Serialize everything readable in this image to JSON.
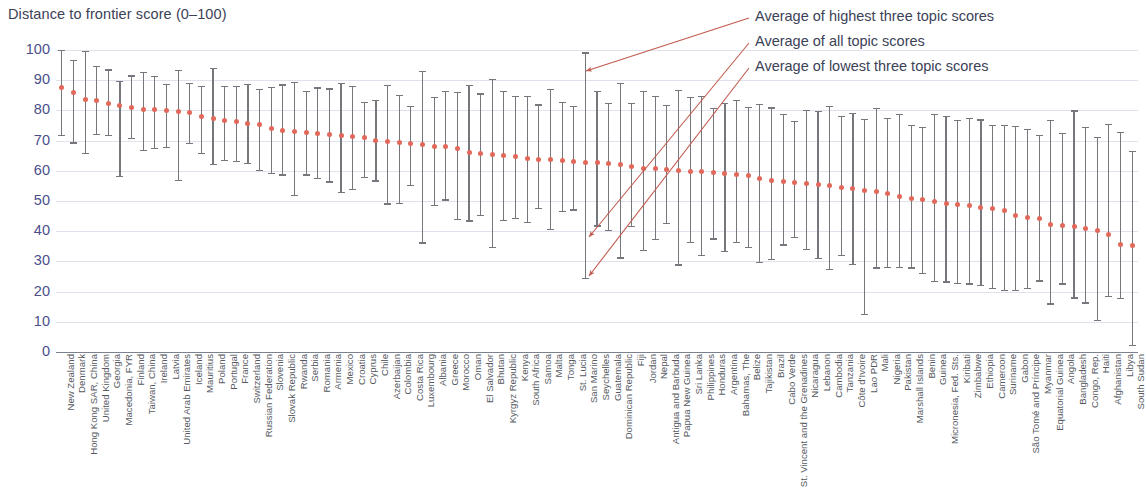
{
  "chart_data": {
    "type": "scatter",
    "title": "Distance to frontier score (0–100)",
    "xlabel": "",
    "ylabel": "Distance to frontier score (0–100)",
    "ylim": [
      0,
      100
    ],
    "yticks": [
      0,
      10,
      20,
      30,
      40,
      50,
      60,
      70,
      80,
      90,
      100
    ],
    "grid": true,
    "legend_position": "top-right-annotations",
    "annotations": [
      "Average of highest three topic scores",
      "Average of all topic scores",
      "Average of lowest three topic scores"
    ],
    "colors": {
      "marker": "#e2685a",
      "whisker": "#76777c",
      "gridline": "#dfe2ea",
      "ytick_label": "#4a4f8c",
      "text": "#3c4257",
      "annotation_leader": "#c25a4e"
    },
    "series": [
      {
        "name": "Average of highest three topic scores",
        "role": "high"
      },
      {
        "name": "Average of all topic scores",
        "role": "mean"
      },
      {
        "name": "Average of lowest three topic scores",
        "role": "low"
      }
    ],
    "categories": [
      "New Zealand",
      "Denmark",
      "Hong Kong SAR, China",
      "United Kingdom",
      "Georgia",
      "Macedonia, FYR",
      "Finland",
      "Taiwan, China",
      "Ireland",
      "Latvia",
      "United Arab Emirates",
      "Iceland",
      "Mauritius",
      "Poland",
      "Portugal",
      "France",
      "Switzerland",
      "Russian Federation",
      "Slovenia",
      "Slovak Republic",
      "Rwanda",
      "Serbia",
      "Romania",
      "Armenia",
      "Mexico",
      "Croatia",
      "Cyprus",
      "Chile",
      "Azerbaijan",
      "Colombia",
      "Costa Rica",
      "Luxembourg",
      "Albania",
      "Greece",
      "Morocco",
      "Oman",
      "El Salvador",
      "Bhutan",
      "Kyrgyz Republic",
      "Kenya",
      "South Africa",
      "Samoa",
      "Malta",
      "Tonga",
      "St. Lucia",
      "San Marino",
      "Seychelles",
      "Guatemala",
      "Dominican Republic",
      "Fiji",
      "Jordan",
      "Nepal",
      "Antigua and Barbuda",
      "Papua New Guinea",
      "Sri Lanka",
      "Philippines",
      "Honduras",
      "Argentina",
      "Bahamas, The",
      "Belize",
      "Tajikistan",
      "Brazil",
      "Cabo Verde",
      "St. Vincent and the Grenadines",
      "Nicaragua",
      "Lebanon",
      "Cambodia",
      "Tanzania",
      "Côte d'Ivoire",
      "Lao PDR",
      "Mali",
      "Nigeria",
      "Pakistan",
      "Marshall Islands",
      "Benin",
      "Guinea",
      "Micronesia, Fed. Sts.",
      "Kiribati",
      "Zimbabwe",
      "Ethiopia",
      "Cameroon",
      "Suriname",
      "Gabon",
      "São Tomé and Príncipe",
      "Myanmar",
      "Equatorial Guinea",
      "Angola",
      "Bangladesh",
      "Congo, Rep.",
      "Haiti",
      "Afghanistan",
      "Libya",
      "South Sudan"
    ],
    "mean": [
      87.5,
      86.0,
      83.5,
      83.3,
      82.2,
      81.5,
      80.8,
      80.4,
      80.2,
      80.0,
      79.7,
      79.3,
      78.0,
      77.2,
      76.8,
      76.3,
      75.6,
      75.2,
      74.0,
      73.4,
      73.0,
      72.7,
      72.4,
      72.1,
      71.6,
      71.4,
      70.9,
      70.2,
      69.8,
      69.3,
      69.0,
      68.6,
      68.2,
      68.0,
      67.4,
      66.0,
      65.8,
      65.5,
      65.2,
      64.6,
      64.2,
      63.9,
      63.6,
      63.3,
      63.1,
      62.9,
      62.7,
      62.4,
      62.0,
      61.4,
      60.9,
      60.6,
      60.3,
      60.1,
      59.9,
      59.7,
      59.5,
      59.2,
      58.9,
      58.6,
      57.6,
      56.8,
      56.4,
      56.0,
      55.7,
      55.3,
      55.0,
      54.6,
      54.0,
      53.6,
      53.2,
      52.5,
      51.6,
      50.7,
      50.4,
      49.9,
      49.2,
      48.9,
      48.4,
      47.9,
      47.4,
      46.7,
      45.2,
      44.6,
      44.2,
      42.3,
      41.8,
      41.5,
      41.0,
      40.2,
      38.8,
      35.7,
      35.4,
      32.1
    ],
    "high": [
      100.0,
      96.8,
      99.8,
      94.6,
      93.6,
      89.9,
      91.6,
      92.8,
      91.4,
      88.9,
      93.4,
      89.2,
      88.1,
      94.0,
      88.1,
      88.1,
      88.8,
      87.0,
      87.7,
      88.6,
      89.5,
      86.5,
      87.6,
      87.3,
      89.0,
      88.2,
      82.9,
      83.4,
      88.5,
      85.0,
      81.6,
      93.0,
      84.5,
      86.5,
      86.0,
      88.4,
      85.6,
      90.3,
      86.4,
      84.9,
      84.9,
      82.0,
      87.0,
      82.7,
      81.6,
      99.2,
      86.5,
      82.5,
      89.1,
      82.4,
      86.4,
      84.8,
      81.7,
      86.7,
      84.6,
      84.9,
      80.7,
      82.6,
      83.4,
      81.2,
      82.2,
      81.0,
      78.8,
      76.6,
      80.2,
      79.9,
      81.5,
      78.1,
      79.1,
      77.2,
      80.8,
      77.5,
      78.8,
      75.1,
      74.4,
      78.9,
      78.1,
      76.8,
      77.6,
      77.0,
      75.1,
      75.1,
      74.9,
      74.0,
      71.9,
      76.9,
      72.6,
      80.0,
      74.5,
      71.3,
      75.4,
      72.9,
      66.6,
      68.8
    ],
    "low": [
      71.9,
      69.4,
      65.8,
      72.3,
      71.9,
      58.3,
      71.0,
      66.9,
      67.5,
      67.9,
      57.0,
      69.3,
      65.9,
      62.2,
      63.6,
      63.4,
      62.6,
      60.2,
      59.4,
      58.8,
      52.0,
      58.8,
      57.7,
      56.5,
      52.9,
      54.0,
      58.0,
      56.8,
      49.2,
      49.5,
      55.3,
      36.3,
      48.8,
      50.5,
      44.1,
      43.6,
      45.3,
      34.7,
      43.7,
      44.3,
      43.2,
      47.6,
      40.7,
      46.6,
      47.2,
      24.5,
      41.9,
      40.5,
      31.3,
      41.8,
      33.9,
      37.4,
      42.8,
      29.0,
      36.4,
      32.2,
      37.6,
      33.6,
      36.5,
      34.8,
      29.9,
      30.9,
      35.6,
      38.1,
      34.1,
      31.2,
      27.6,
      32.2,
      29.1,
      12.5,
      28.0,
      28.2,
      28.2,
      28.0,
      26.1,
      23.6,
      23.4,
      22.9,
      22.7,
      22.2,
      21.2,
      20.6,
      20.6,
      21.1,
      23.7,
      16.1,
      22.7,
      18.1,
      16.4,
      10.6,
      18.5,
      17.8,
      2.3,
      4.9
    ]
  },
  "axis": {
    "title": "Distance to frontier score (0–100)"
  }
}
